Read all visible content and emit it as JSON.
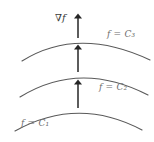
{
  "figure": {
    "name": "gradient-and-level-curves-diagram",
    "background_color": "#ffffff",
    "curve_color": "#5a5a5a",
    "arrow_color": "#262626",
    "label_color": "#6e6e6e",
    "gradient_label_color": "#3a3a3a"
  },
  "labels": {
    "gradient": "∇f",
    "level_top": "f = C₃",
    "level_middle": "f = C₂",
    "level_bottom": "f = C₁"
  },
  "chart_data": {
    "type": "line",
    "title": "",
    "xlabel": "",
    "ylabel": "",
    "grid": false,
    "legend": "none",
    "series": [
      {
        "name": "f = C₃",
        "role": "level-curve-top",
        "path": "M 22 61 Q 78 26 150 60"
      },
      {
        "name": "f = C₂",
        "role": "level-curve-middle",
        "path": "M 20 97 Q 80 60 148 95"
      },
      {
        "name": "f = C₁",
        "role": "level-curve-bottom",
        "path": "M 15 131 Q 78 96 142 130"
      }
    ],
    "arrows": [
      {
        "name": "gradient-arrow-top",
        "x": 78,
        "y_tail": 38,
        "y_head": 16
      },
      {
        "name": "gradient-arrow-middle",
        "x": 78,
        "y_tail": 72,
        "y_head": 47
      },
      {
        "name": "gradient-arrow-bottom",
        "x": 78,
        "y_tail": 108,
        "y_head": 82
      }
    ]
  }
}
